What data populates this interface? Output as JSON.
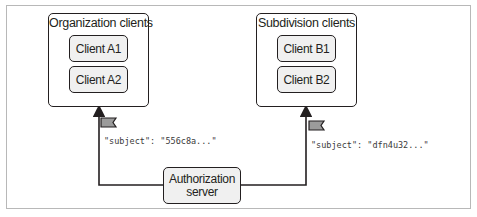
{
  "diagram": {
    "groups": [
      {
        "title": "Organization clients",
        "clients": [
          "Client A1",
          "Client A2"
        ]
      },
      {
        "title": "Subdivision clients",
        "clients": [
          "Client B1",
          "Client B2"
        ]
      }
    ],
    "server": {
      "line1": "Authorization",
      "line2": "server"
    },
    "tokens": [
      {
        "subject": "\"subject\": \"556c8a...\""
      },
      {
        "subject": "\"subject\": \"dfn4u32...\""
      }
    ],
    "colors": {
      "stroke": "#231f20",
      "box_fill": "#f0f0f0",
      "token_fill": "#9b9b9b",
      "frame": "#b8b8b8"
    }
  }
}
